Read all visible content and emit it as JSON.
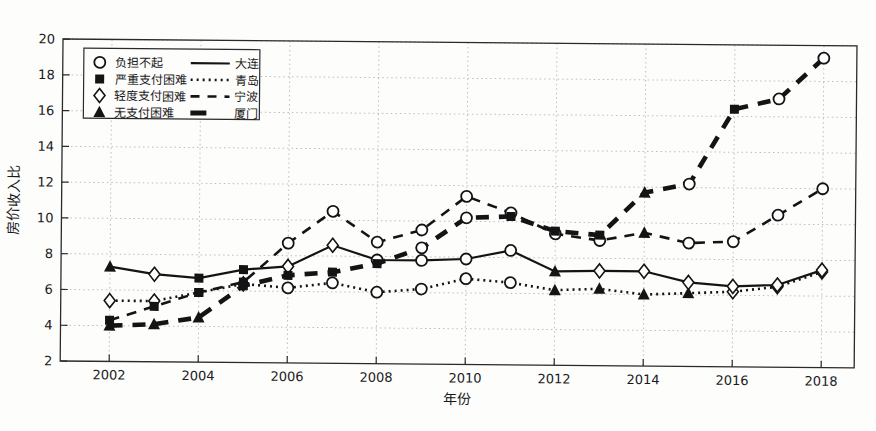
{
  "chart_data": {
    "type": "line",
    "title": "",
    "xlabel": "年份",
    "ylabel": "房价收入比",
    "x": [
      2002,
      2003,
      2004,
      2005,
      2006,
      2007,
      2008,
      2009,
      2010,
      2011,
      2012,
      2013,
      2014,
      2015,
      2016,
      2017,
      2018
    ],
    "xticks": [
      2002,
      2004,
      2006,
      2008,
      2010,
      2012,
      2014,
      2016,
      2018
    ],
    "yticks": [
      2,
      4,
      6,
      8,
      10,
      12,
      14,
      16,
      18,
      20
    ],
    "xlim": [
      2000.9,
      2018.75
    ],
    "ylim": [
      2,
      20
    ],
    "grid": true,
    "legend_position": "top-left",
    "marker_legend": [
      {
        "id": "unaffordable",
        "marker": "circle",
        "label": "负担不起"
      },
      {
        "id": "severe",
        "marker": "square",
        "label": "严重支付困难"
      },
      {
        "id": "mild",
        "marker": "diamond",
        "label": "轻度支付困难"
      },
      {
        "id": "none",
        "marker": "triangle",
        "label": "无支付困难"
      }
    ],
    "line_legend": [
      {
        "id": "dalian",
        "line": "solid",
        "label": "大连"
      },
      {
        "id": "qingdao",
        "line": "dotted",
        "label": "青岛"
      },
      {
        "id": "ningbo",
        "line": "dashed",
        "label": "宁波"
      },
      {
        "id": "xiamen",
        "line": "thick-dashed",
        "label": "厦门"
      }
    ],
    "series": [
      {
        "id": "qingdao",
        "name": "青岛",
        "line": "dotted",
        "values": [
          5.4,
          5.4,
          5.9,
          6.4,
          6.2,
          6.5,
          6.0,
          6.2,
          6.8,
          6.6,
          6.2,
          6.3,
          6.0,
          6.1,
          6.2,
          6.5,
          7.35
        ],
        "markers": [
          "diamond",
          "diamond",
          "square",
          "diamond",
          "circle",
          "circle",
          "circle",
          "circle",
          "circle",
          "circle",
          "triangle",
          "triangle",
          "triangle",
          "triangle",
          "diamond",
          "diamond",
          "diamond"
        ]
      },
      {
        "id": "ningbo",
        "name": "宁波",
        "line": "dashed",
        "values": [
          4.3,
          5.1,
          5.9,
          6.5,
          8.7,
          10.5,
          8.8,
          9.5,
          11.4,
          10.5,
          9.35,
          9.0,
          9.45,
          8.9,
          9.0,
          10.5,
          12.0
        ],
        "markers": [
          "square",
          "square",
          "square",
          "square",
          "circle",
          "circle",
          "circle",
          "circle",
          "circle",
          "circle",
          "circle",
          "circle",
          "triangle",
          "circle",
          "circle",
          "circle",
          "circle"
        ]
      },
      {
        "id": "dalian",
        "name": "大连",
        "line": "solid",
        "values": [
          7.3,
          6.9,
          6.7,
          7.2,
          7.4,
          8.6,
          7.8,
          7.8,
          7.9,
          8.4,
          7.25,
          7.3,
          7.3,
          6.7,
          6.5,
          6.6,
          7.45
        ],
        "markers": [
          "triangle",
          "diamond",
          "square",
          "square",
          "diamond",
          "diamond",
          "circle",
          "circle",
          "circle",
          "circle",
          "triangle",
          "diamond",
          "diamond",
          "diamond",
          "diamond",
          "diamond",
          "diamond"
        ]
      },
      {
        "id": "xiamen",
        "name": "厦门",
        "line": "thick-dashed",
        "values": [
          4.0,
          4.1,
          4.5,
          6.3,
          6.9,
          7.1,
          7.6,
          8.5,
          10.2,
          10.3,
          9.5,
          9.3,
          11.7,
          12.2,
          16.4,
          17.0,
          19.3
        ],
        "markers": [
          "triangle",
          "triangle",
          "triangle",
          "square",
          "square",
          "square",
          "square",
          "circle",
          "circle",
          "square",
          "square",
          "square",
          "triangle",
          "circle",
          "square",
          "circle",
          "circle"
        ]
      }
    ]
  },
  "colors": {
    "line": "#141414",
    "marker_fill": "#ffffff",
    "grid": "#bdbdbd",
    "axis": "#2a2a2a",
    "background": "#fdfdfc",
    "legend_border": "#2a2a2a"
  }
}
